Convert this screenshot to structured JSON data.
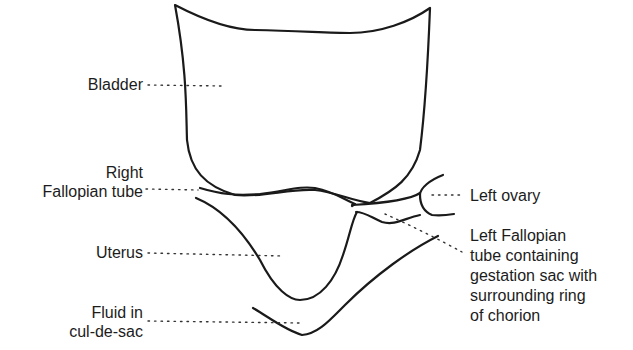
{
  "diagram": {
    "type": "anatomical line drawing (ultrasound schematic)",
    "structures": [
      "bladder",
      "right-fallopian-tube",
      "uterus",
      "left-ovary",
      "left-fallopian-tube",
      "cul-de-sac-fluid"
    ]
  },
  "labels": {
    "bladder": [
      "Bladder"
    ],
    "right_fallopian_tube": [
      "Right",
      "Fallopian tube"
    ],
    "uterus": [
      "Uterus"
    ],
    "fluid": [
      "Fluid in",
      "cul-de-sac"
    ],
    "left_ovary": [
      "Left ovary"
    ],
    "left_fallopian_tube": [
      "Left Fallopian",
      "tube containing",
      "gestation sac with",
      "surrounding ring",
      "of chorion"
    ]
  },
  "colors": {
    "line": "#1a1a1a",
    "text": "#1c1c1c",
    "background": "#ffffff"
  }
}
